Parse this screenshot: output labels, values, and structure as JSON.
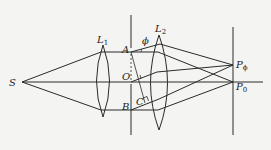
{
  "diagram": {
    "type": "optics-ray-diagram",
    "labels": {
      "source": "S",
      "lens1": "L",
      "lens1_sub": "1",
      "lens2": "L",
      "lens2_sub": "2",
      "point_a": "A",
      "point_o": "O",
      "point_b": "B",
      "point_c": "C",
      "angle": "ϕ",
      "screen_point_phi": "P",
      "screen_point_phi_sub": "ϕ",
      "screen_point_zero": "P",
      "screen_point_zero_sub": "0"
    },
    "colors": {
      "background": "#f4f4f2",
      "stroke": "#2a2a2a"
    }
  }
}
